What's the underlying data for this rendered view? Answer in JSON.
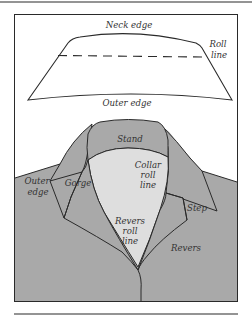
{
  "figure": {
    "type": "collar diagram",
    "colors": {
      "background": "#ffffff",
      "line": "#2a2a2a",
      "garment_fill": "#a9a9a9",
      "inner_fill": "#dedede",
      "label_text": "#333333"
    }
  },
  "flat_collar": {
    "labels": {
      "neck_edge": "Neck edge",
      "roll_line_1": "Roll",
      "roll_line_2": "line",
      "outer_edge": "Outer edge"
    }
  },
  "worn_collar": {
    "labels": {
      "stand": "Stand",
      "collar_roll_line_1": "Collar",
      "collar_roll_line_2": "roll",
      "collar_roll_line_3": "line",
      "outer_edge_1": "Outer",
      "outer_edge_2": "edge",
      "gorge": "Gorge",
      "step": "Step",
      "revers_roll_line_1": "Revers",
      "revers_roll_line_2": "roll",
      "revers_roll_line_3": "line",
      "revers": "Revers"
    }
  }
}
